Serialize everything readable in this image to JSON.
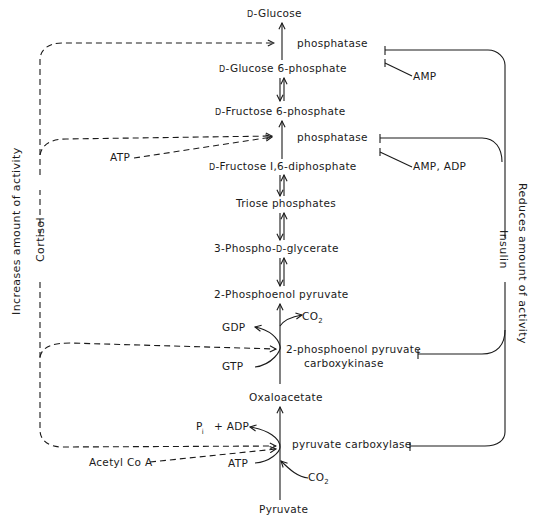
{
  "diagram": {
    "type": "metabolic-pathway",
    "pathway_name": "Gluconeogenesis regulation",
    "metabolites": {
      "glucose": {
        "prefix": "D",
        "name": "-Glucose"
      },
      "g6p": {
        "prefix": "D",
        "name": "-Glucose 6-phosphate"
      },
      "f6p": {
        "prefix": "D",
        "name": "-Fructose 6-phosphate"
      },
      "fbp": {
        "prefix": "D",
        "name": "-Fructose I,6-diphosphate"
      },
      "triose": {
        "name": "Triose phosphates"
      },
      "pga": {
        "pre": "3-Phospho-",
        "prefix": "D",
        "name": "-glycerate"
      },
      "pep": {
        "name": "2-Phosphoenol pyruvate"
      },
      "oaa": {
        "name": "Oxaloacetate"
      },
      "pyruvate": {
        "name": "Pyruvate"
      }
    },
    "enzymes": {
      "g6pase": "phosphatase",
      "fbpase": "phosphatase",
      "pepck_line1": "2-phosphoenol pyruvate",
      "pepck_line2": "carboxykinase",
      "pc": "pyruvate carboxylase"
    },
    "cofactors": {
      "atp_fbpase": "ATP",
      "gdp": "GDP",
      "gtp": "GTP",
      "co2_pepck": "CO",
      "co2_pepck_sub": "2",
      "pi": "P",
      "pi_sub": "i",
      "adp_pc": "+ ADP",
      "atp_pc": "ATP",
      "co2_pc": "CO",
      "co2_pc_sub": "2",
      "acetyl_coa": "Acetyl Co A"
    },
    "inhibitors": {
      "amp": "AMP",
      "amp_adp": "AMP, ADP"
    },
    "hormones": {
      "cortisol": "Cortisol",
      "insulin": "Insulin"
    },
    "side_labels": {
      "left": "Increases amount of activity",
      "right": "Reduces amount of activity"
    },
    "relations": [
      {
        "from": "Cortisol",
        "to": [
          "phosphatase (G6Pase)",
          "phosphatase (FBPase)",
          "2-phosphoenol pyruvate carboxykinase",
          "pyruvate carboxylase"
        ],
        "effect": "increases"
      },
      {
        "from": "Insulin",
        "to": [
          "phosphatase (G6Pase)",
          "phosphatase (FBPase)",
          "2-phosphoenol pyruvate carboxykinase",
          "pyruvate carboxylase"
        ],
        "effect": "reduces"
      },
      {
        "from": "ATP",
        "to": "phosphatase (FBPase)",
        "effect": "activates"
      },
      {
        "from": "Acetyl Co A",
        "to": "pyruvate carboxylase",
        "effect": "activates"
      },
      {
        "from": "AMP",
        "to": "phosphatase (G6Pase)",
        "effect": "inhibits"
      },
      {
        "from": "AMP, ADP",
        "to": "phosphatase (FBPase)",
        "effect": "inhibits"
      }
    ]
  }
}
